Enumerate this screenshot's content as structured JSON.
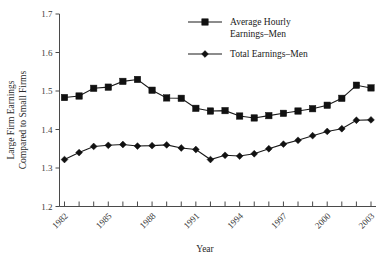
{
  "chart_data": {
    "type": "line",
    "title": "",
    "xlabel": "Year",
    "ylabel": "Large Firm Earnings Compared to Small Firms",
    "ylabel_lines": [
      "Large Firm Earnings",
      "Compared to Small Firms"
    ],
    "x": [
      1982,
      1983,
      1984,
      1985,
      1986,
      1987,
      1988,
      1989,
      1990,
      1991,
      1992,
      1993,
      1994,
      1995,
      1996,
      1997,
      1998,
      1999,
      2000,
      2001,
      2002,
      2003
    ],
    "categories": [
      "1982",
      "1983",
      "1984",
      "1985",
      "1986",
      "1987",
      "1988",
      "1989",
      "1990",
      "1991",
      "1992",
      "1993",
      "1994",
      "1995",
      "1996",
      "1997",
      "1998",
      "1999",
      "2000",
      "2001",
      "2002",
      "2003"
    ],
    "xtick_labels": [
      "1982",
      "1985",
      "1988",
      "1991",
      "1994",
      "1997",
      "2000",
      "2003"
    ],
    "xtick_values": [
      1982,
      1985,
      1988,
      1991,
      1994,
      1997,
      2000,
      2003
    ],
    "ytick_labels": [
      "1.2",
      "1.3",
      "1.4",
      "1.5",
      "1.6",
      "1.7"
    ],
    "ytick_values": [
      1.2,
      1.3,
      1.4,
      1.5,
      1.6,
      1.7
    ],
    "ylim": [
      1.2,
      1.7
    ],
    "xlim": [
      1982,
      2003
    ],
    "grid": false,
    "legend_position": "top-right",
    "series": [
      {
        "name": "Average Hourly Earnings–Men",
        "name_lines": [
          "Average Hourly",
          "Earnings–Men"
        ],
        "marker": "square",
        "color": "#111111",
        "values": [
          1.483,
          1.487,
          1.507,
          1.51,
          1.525,
          1.53,
          1.502,
          1.482,
          1.481,
          1.455,
          1.448,
          1.449,
          1.435,
          1.43,
          1.436,
          1.442,
          1.448,
          1.454,
          1.463,
          1.481,
          1.515,
          1.508
        ]
      },
      {
        "name": "Total Earnings–Men",
        "name_lines": [
          "Total Earnings–Men"
        ],
        "marker": "diamond",
        "color": "#111111",
        "values": [
          1.322,
          1.34,
          1.356,
          1.359,
          1.361,
          1.357,
          1.358,
          1.36,
          1.352,
          1.348,
          1.322,
          1.333,
          1.331,
          1.337,
          1.35,
          1.362,
          1.372,
          1.384,
          1.395,
          1.402,
          1.424,
          1.425
        ]
      }
    ]
  },
  "legend": {
    "entries": [
      {
        "label_line1": "Average Hourly",
        "label_line2": "Earnings–Men",
        "marker": "square"
      },
      {
        "label_line1": "Total Earnings–Men",
        "label_line2": "",
        "marker": "diamond"
      }
    ]
  },
  "axes": {
    "x_title": "Year",
    "y_title_line1": "Large Firm Earnings",
    "y_title_line2": "Compared to Small Firms"
  }
}
